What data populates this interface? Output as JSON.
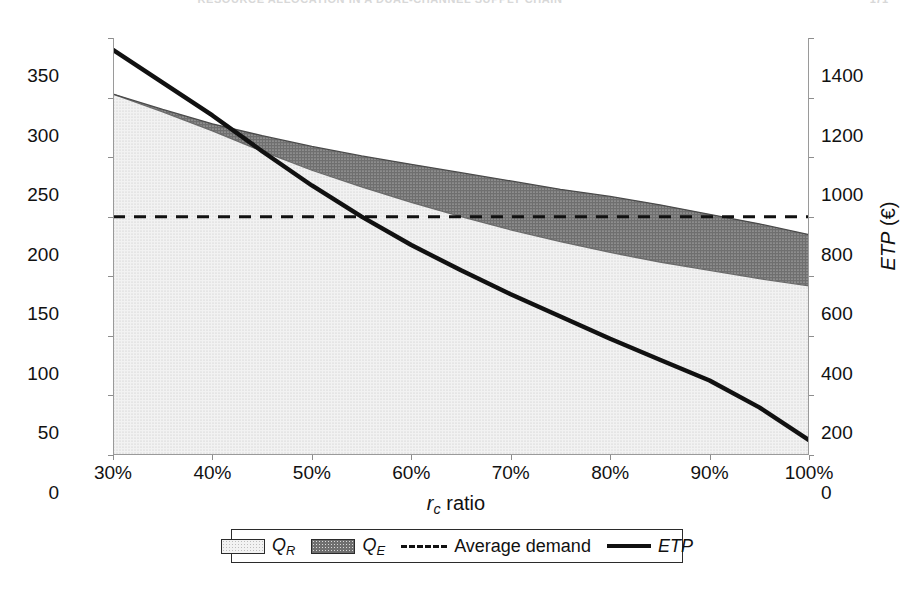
{
  "header": {
    "running_title": "RESOURCE ALLOCATION IN A DUAL-CHANNEL SUPPLY CHAIN",
    "page_number": "171"
  },
  "axes": {
    "y_left": {
      "title_html": "Q_R, Q_E (product units)",
      "ticks": [
        0,
        50,
        100,
        150,
        200,
        250,
        300,
        350
      ],
      "min": 0,
      "max": 350
    },
    "y_right": {
      "title_html": "ETP (€)",
      "ticks": [
        0,
        200,
        400,
        600,
        800,
        1000,
        1200,
        1400
      ],
      "min": 0,
      "max": 1400
    },
    "x": {
      "title_html": "r_c ratio",
      "ticks": [
        "30%",
        "40%",
        "50%",
        "60%",
        "70%",
        "80%",
        "90%",
        "100%"
      ],
      "min": 30,
      "max": 100
    }
  },
  "legend": {
    "items": [
      {
        "key": "qr",
        "label": "Q",
        "sub": "R",
        "marker": "swatch-light"
      },
      {
        "key": "qe",
        "label": "Q",
        "sub": "E",
        "marker": "swatch-dark"
      },
      {
        "key": "avg",
        "label": "Average demand",
        "sub": "",
        "marker": "dashed-line"
      },
      {
        "key": "etp",
        "label": "ETP",
        "sub": "",
        "marker": "solid-line"
      }
    ]
  },
  "colors": {
    "qr_fill": "#f2f2f2",
    "qr_dots": "#c4c4c4",
    "qe_fill": "#6f6f6f",
    "qe_dots": "#d6d6d6",
    "line": "#111111",
    "axis": "#9a9a9a",
    "boundary": "#5a5a5a"
  },
  "chart_data": {
    "type": "area",
    "title": "",
    "subtitle": "",
    "xlabel": "r_c ratio",
    "ylabel": "Q_R, Q_E (product units)",
    "y2label": "ETP (€)",
    "xlim": [
      30,
      100
    ],
    "ylim": [
      0,
      350
    ],
    "y2lim": [
      0,
      1400
    ],
    "grid": false,
    "legend_position": "below-plot",
    "x": [
      30,
      35,
      40,
      45,
      50,
      55,
      60,
      65,
      70,
      75,
      80,
      85,
      90,
      95,
      100
    ],
    "series": [
      {
        "name": "Q_R",
        "type": "stacked-area",
        "axis": "left",
        "fill": "light-dotted",
        "values": [
          303,
          288,
          272,
          255,
          239,
          225,
          212,
          200,
          189,
          179,
          170,
          162,
          155,
          148,
          142
        ]
      },
      {
        "name": "Q_E",
        "type": "stacked-area",
        "axis": "left",
        "fill": "dark-dotted",
        "stacked_top": [
          303,
          290,
          278,
          268,
          259,
          251,
          244,
          237,
          230,
          223,
          217,
          210,
          202,
          194,
          185
        ],
        "values": [
          0,
          2,
          6,
          13,
          20,
          26,
          32,
          37,
          41,
          44,
          47,
          48,
          47,
          46,
          43
        ]
      },
      {
        "name": "Average demand",
        "type": "line",
        "axis": "left",
        "style": "dashed",
        "constant": 200,
        "values": [
          200,
          200,
          200,
          200,
          200,
          200,
          200,
          200,
          200,
          200,
          200,
          200,
          200,
          200,
          200
        ]
      },
      {
        "name": "ETP",
        "type": "line",
        "axis": "right",
        "style": "solid",
        "values": [
          1360,
          1250,
          1140,
          1020,
          905,
          800,
          705,
          620,
          540,
          465,
          390,
          320,
          250,
          160,
          50
        ]
      }
    ],
    "annotations": [
      {
        "text": "ETP crosses average demand level near r_c ≈ 53%"
      },
      {
        "text": "Q_R + Q_E falls below average demand near r_c ≈ 83%"
      }
    ]
  }
}
